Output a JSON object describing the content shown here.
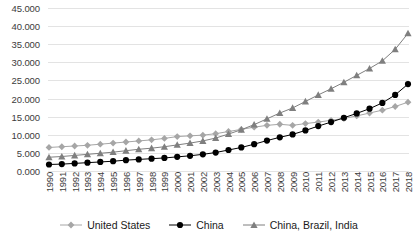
{
  "chart_data": {
    "type": "line",
    "title": "",
    "xlabel": "",
    "ylabel": "",
    "ylim": [
      0,
      45000
    ],
    "ytick_step": 5000,
    "grid": true,
    "legend_position": "bottom",
    "ytick_labels": [
      "0.000",
      "5.000",
      "10.000",
      "15.000",
      "20.000",
      "25.000",
      "30.000",
      "35.000",
      "40.000",
      "45.000"
    ],
    "ytick_values": [
      0,
      5000,
      10000,
      15000,
      20000,
      25000,
      30000,
      35000,
      40000,
      45000
    ],
    "categories": [
      "1990",
      "1991",
      "1992",
      "1993",
      "1994",
      "1995",
      "1996",
      "1997",
      "1998",
      "1999",
      "2000",
      "2001",
      "2002",
      "2003",
      "2004",
      "2005",
      "2006",
      "2007",
      "2008",
      "2009",
      "2010",
      "2011",
      "2012",
      "2013",
      "2014",
      "2015",
      "2016",
      "2017",
      "2018"
    ],
    "series": [
      {
        "name": "United States",
        "color": "#A6A6A6",
        "marker": "diamond",
        "values": [
          6500,
          6700,
          6900,
          7100,
          7400,
          7700,
          8000,
          8300,
          8600,
          9000,
          9500,
          9700,
          9900,
          10300,
          10900,
          11500,
          12100,
          12600,
          12900,
          12600,
          13100,
          13500,
          14000,
          14500,
          15200,
          16000,
          16800,
          17800,
          19000
        ]
      },
      {
        "name": "China",
        "color": "#000000",
        "marker": "circle",
        "values": [
          1800,
          1900,
          2100,
          2300,
          2500,
          2700,
          3000,
          3200,
          3400,
          3600,
          3900,
          4200,
          4600,
          5100,
          5800,
          6500,
          7400,
          8400,
          9300,
          10100,
          11200,
          12400,
          13500,
          14700,
          15900,
          17200,
          18800,
          21000,
          24000
        ]
      },
      {
        "name": "China, Brazil, India",
        "color": "#7F7F7F",
        "marker": "triangle",
        "values": [
          3800,
          4000,
          4300,
          4600,
          4900,
          5200,
          5600,
          6000,
          6300,
          6700,
          7200,
          7700,
          8300,
          9100,
          10200,
          11400,
          12800,
          14400,
          16000,
          17400,
          19200,
          21000,
          22700,
          24500,
          26400,
          28300,
          30400,
          33600,
          38000
        ]
      }
    ]
  },
  "legend": {
    "items": [
      {
        "label": "United States",
        "marker": "diamond-marker",
        "color": "#A6A6A6"
      },
      {
        "label": "China",
        "marker": "circle-marker",
        "color": "#000000"
      },
      {
        "label": "China, Brazil, India",
        "marker": "triangle-marker",
        "color": "#7F7F7F"
      }
    ]
  }
}
